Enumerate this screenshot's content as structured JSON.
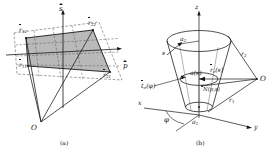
{
  "figure": {
    "kind": "two-panel-geometry-diagram",
    "ink_color": "#161616",
    "fill_color": "#b9b9b9",
    "background": "#ffffff"
  },
  "panel_a": {
    "caption": "(a)",
    "origin_label": "O",
    "axes": [
      {
        "name": "s-axis",
        "symbol": "s",
        "accent": "hat"
      },
      {
        "name": "p-axis",
        "symbol": "p",
        "accent": "hat"
      }
    ],
    "corner_vectors": [
      {
        "base": "r",
        "sub": "12",
        "accent": "vec",
        "corner": "top-left"
      },
      {
        "base": "r",
        "sub": "22",
        "accent": "vec",
        "corner": "top-right"
      },
      {
        "base": "r",
        "sub": "11",
        "accent": "vec",
        "corner": "bottom-left"
      },
      {
        "base": "r",
        "sub": "21",
        "accent": "vec",
        "corner": "bottom-right"
      }
    ]
  },
  "panel_b": {
    "caption": "(b)",
    "origin_label": "O",
    "axes": [
      {
        "name": "x-axis",
        "symbol": "x"
      },
      {
        "name": "y-axis",
        "symbol": "y"
      },
      {
        "name": "z-axis",
        "symbol": "z"
      }
    ],
    "labels": [
      {
        "name": "angle-phi",
        "symbol": "φ"
      },
      {
        "name": "radius-a1",
        "base": "a",
        "sub": "1"
      },
      {
        "name": "radius-a2",
        "base": "a",
        "sub": "2"
      },
      {
        "name": "arclength-s",
        "symbol": "s"
      },
      {
        "name": "radius-a-of-s",
        "text": "a(s)"
      },
      {
        "name": "point-N",
        "text": "N(p,s)"
      },
      {
        "name": "tangent-vector",
        "base": "t",
        "sub": "σ",
        "arg": "(φ)",
        "accent": "vec"
      },
      {
        "name": "center-vector",
        "base": "r",
        "sub": "c",
        "arg": "(s)",
        "accent": "vec"
      },
      {
        "name": "distance-r1",
        "base": "r",
        "sub": "1"
      },
      {
        "name": "distance-r2",
        "base": "r",
        "sub": "2"
      }
    ]
  }
}
